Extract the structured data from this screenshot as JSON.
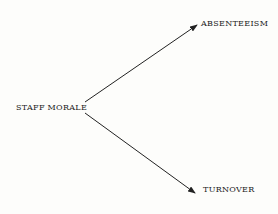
{
  "diagram": {
    "source": {
      "label": "STAFF MORALE"
    },
    "targets": [
      {
        "label": "ABSENTEEISM"
      },
      {
        "label": "TURNOVER"
      }
    ],
    "edges": [
      {
        "from": "STAFF MORALE",
        "to": "ABSENTEEISM"
      },
      {
        "from": "STAFF MORALE",
        "to": "TURNOVER"
      }
    ],
    "colors": {
      "line": "#222222",
      "background": "#fdfdfb"
    }
  }
}
